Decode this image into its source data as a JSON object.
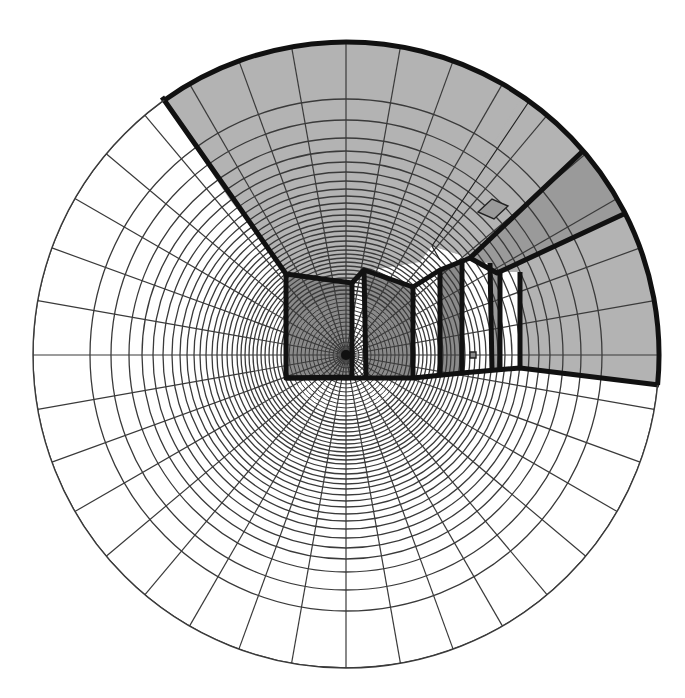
{
  "diagram": {
    "type": "fisheye-sky-view-polar-grid",
    "canvas": {
      "width": 685,
      "height": 698
    },
    "center": {
      "x": 346,
      "y": 355
    },
    "outer_radius": 313,
    "spoke_step_deg": 10,
    "ring_radii": [
      313,
      256,
      235,
      217,
      204,
      193,
      183,
      174,
      166,
      159,
      152,
      146,
      140,
      134,
      129,
      124,
      119,
      114,
      109,
      105,
      101,
      97,
      93,
      89,
      85,
      81,
      77,
      73,
      69,
      65,
      61,
      57,
      53,
      49,
      45,
      41,
      37,
      33,
      29,
      25,
      21,
      17,
      13,
      9
    ],
    "colors": {
      "background": "#ffffff",
      "grid_line": "#3a3a3a",
      "sky": "#ffffff",
      "ceiling": "#b3b3b3",
      "wall_dark": "#8a8a8a",
      "band_dark": "#9a9a9a",
      "window": "#ffffff",
      "outline": "#111111"
    },
    "regions": [
      {
        "name": "ceiling",
        "fill": "#b3b3b3",
        "points": "162,97 205,70 250,54 300,43 346,41 395,44 445,52 490,66 530,83 560,101 584,150 470,258 432,246 420,262 372,270 352,282 286,274 262,240 230,200 200,155"
      },
      {
        "name": "upper-right-ceiling",
        "fill": "#b3b3b3",
        "points": "530,83 560,101 584,150 470,258 432,246"
      },
      {
        "name": "dark-band",
        "fill": "#9a9a9a",
        "points": "584,150 605,180 626,213 497,273 470,258"
      },
      {
        "name": "right-wall",
        "fill": "#b3b3b3",
        "points": "626,213 640,245 652,285 658,330 659,385 520,368 520,272 497,273"
      },
      {
        "name": "left-wall-panel",
        "fill": "#8a8a8a",
        "points": "286,274 352,283 352,377 286,378"
      },
      {
        "name": "middle-wall-panel",
        "fill": "#8a8a8a",
        "points": "364,270 413,287 413,378 366,378"
      },
      {
        "name": "window-strip-1",
        "fill": "#8a8a8a",
        "points": "440,270 462,262 462,373 440,376"
      },
      {
        "name": "window-strip-2",
        "fill": "#9a9a9a",
        "points": "490,263 498,272 500,368 492,370"
      }
    ],
    "windows": [
      {
        "name": "gap-strip",
        "points": "352,283 364,270 366,378 352,377"
      },
      {
        "name": "window-a",
        "points": "413,287 440,270 440,376 413,378"
      },
      {
        "name": "window-b",
        "points": "462,262 490,263 492,370 462,373"
      },
      {
        "name": "window-c",
        "points": "500,272 520,272 520,368 500,368"
      }
    ],
    "outlines": [
      "162,97 286,274 352,283 364,270 413,287 440,270 470,258 584,150",
      "286,274 286,378 352,377 352,283",
      "364,270 366,378",
      "413,287 413,378",
      "440,270 440,376",
      "462,262 462,373",
      "490,263 492,370",
      "500,272 500,368",
      "520,272 520,368",
      "470,258 497,273 626,213",
      "286,378 413,378 462,373 520,368 659,385"
    ],
    "thin_lines": [
      "530,100 432,246 432,246 440,260"
    ],
    "small_shapes": [
      {
        "name": "ceiling-diamond",
        "points": "478,212 492,199 508,206 494,219",
        "fill": "#9a9a9a"
      },
      {
        "name": "wall-switch",
        "points": "470,352 476,352 476,358 470,358",
        "fill": "#8a8a8a"
      }
    ]
  }
}
